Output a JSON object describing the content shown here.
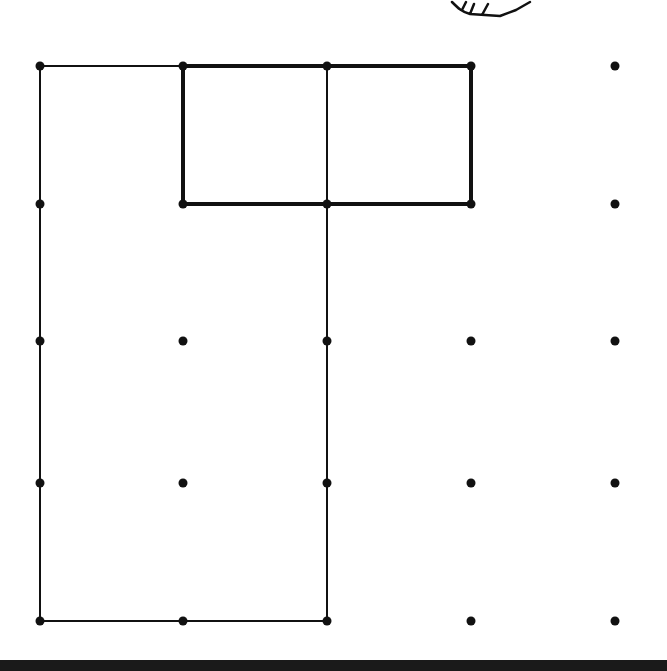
{
  "diagram": {
    "type": "geoboard-dot-grid",
    "grid": {
      "columns_x": [
        40,
        183,
        327,
        471,
        615
      ],
      "rows_y": [
        66,
        204,
        341,
        483,
        621
      ],
      "dot_radius": 4.5,
      "dot_color": "#111111"
    },
    "thin_outline": {
      "description": "Large rectangle outline from column 0 to column 2, rows 0 to 4",
      "points": [
        [
          40,
          66
        ],
        [
          327,
          66
        ],
        [
          327,
          621
        ],
        [
          40,
          621
        ]
      ],
      "stroke": "#111111",
      "stroke_width": 2
    },
    "thick_rectangle": {
      "description": "Bold 2x1 rectangle spanning columns 1-3, rows 0-1",
      "points": [
        [
          183,
          66
        ],
        [
          471,
          66
        ],
        [
          471,
          204
        ],
        [
          183,
          204
        ]
      ],
      "stroke": "#111111",
      "stroke_width": 4
    },
    "inner_divider": {
      "description": "Vertical segment at column 2 inside the thick rectangle",
      "from": [
        327,
        66
      ],
      "to": [
        327,
        204
      ]
    },
    "cropped_figure_top": {
      "description": "Partially visible hand-drawn shape at top edge",
      "path": "M452 2 C458 8 462 12 470 14 L500 16 L516 10 L530 2"
    },
    "bottom_bar": {
      "y": 660,
      "height": 11,
      "color": "#1a1a1a"
    }
  }
}
